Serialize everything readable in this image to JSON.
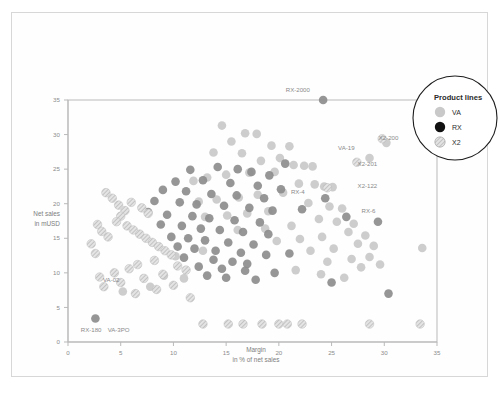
{
  "chart_data": {
    "type": "scatter",
    "title": "",
    "xlabel": "Margin",
    "xlabel_sub": "in % of net sales",
    "ylabel": "Net sales",
    "ylabel_sub": "in mUSD",
    "xlim": [
      0,
      35
    ],
    "ylim": [
      0,
      35
    ],
    "xticks": [
      0,
      5,
      10,
      15,
      20,
      25,
      30,
      35
    ],
    "yticks": [
      0,
      5,
      10,
      15,
      20,
      25,
      30,
      35
    ],
    "grid": false,
    "legend": {
      "title": "Product lines",
      "position": "top-right-circle",
      "entries": [
        {
          "name": "VA",
          "color": "#c9c9c9",
          "style": "solid"
        },
        {
          "name": "RX",
          "color": "#111111",
          "style": "solid"
        },
        {
          "name": "X2",
          "color": "#d2d2d2",
          "style": "hatched"
        }
      ]
    },
    "series": [
      {
        "name": "VA",
        "color": "#c9c9c9",
        "style": "solid",
        "points": [
          [
            14.6,
            31.3
          ],
          [
            16.8,
            30.2
          ],
          [
            17.9,
            30.1
          ],
          [
            15.5,
            29.0
          ],
          [
            19.3,
            28.4
          ],
          [
            21.0,
            28.3
          ],
          [
            13.8,
            27.4
          ],
          [
            16.5,
            27.3
          ],
          [
            18.3,
            26.2
          ],
          [
            20.1,
            26.6
          ],
          [
            21.4,
            25.6
          ],
          [
            22.4,
            25.5
          ],
          [
            23.2,
            25.4
          ],
          [
            19.6,
            24.6
          ],
          [
            17.2,
            24.5
          ],
          [
            15.0,
            24.2
          ],
          [
            13.2,
            23.8
          ],
          [
            11.9,
            23.3
          ],
          [
            21.9,
            22.9
          ],
          [
            23.4,
            22.8
          ],
          [
            24.3,
            22.5
          ],
          [
            25.1,
            22.4
          ],
          [
            20.4,
            21.6
          ],
          [
            18.0,
            21.3
          ],
          [
            16.2,
            20.9
          ],
          [
            14.1,
            20.6
          ],
          [
            12.4,
            20.3
          ],
          [
            22.8,
            20.1
          ],
          [
            24.8,
            19.6
          ],
          [
            26.0,
            19.3
          ],
          [
            19.0,
            18.9
          ],
          [
            17.0,
            18.6
          ],
          [
            15.1,
            18.3
          ],
          [
            13.0,
            18.1
          ],
          [
            23.8,
            17.8
          ],
          [
            25.5,
            17.4
          ],
          [
            27.1,
            17.1
          ],
          [
            21.2,
            16.8
          ],
          [
            18.7,
            16.4
          ],
          [
            16.1,
            16.2
          ],
          [
            26.6,
            15.9
          ],
          [
            28.2,
            15.4
          ],
          [
            24.1,
            15.2
          ],
          [
            22.0,
            14.9
          ],
          [
            19.8,
            14.6
          ],
          [
            27.5,
            14.2
          ],
          [
            29.0,
            13.9
          ],
          [
            25.2,
            13.5
          ],
          [
            23.0,
            13.2
          ],
          [
            33.6,
            13.6
          ],
          [
            28.6,
            12.3
          ],
          [
            26.9,
            12.0
          ],
          [
            24.6,
            11.6
          ],
          [
            29.6,
            11.2
          ],
          [
            27.8,
            10.8
          ],
          [
            21.6,
            10.4
          ],
          [
            24.0,
            9.8
          ],
          [
            26.2,
            9.3
          ],
          [
            5.2,
            7.3
          ],
          [
            9.1,
            9.6
          ],
          [
            11.0,
            9.2
          ],
          [
            7.8,
            8.0
          ],
          [
            28.6,
            26.6
          ],
          [
            12.8,
            13.2
          ],
          [
            30.2,
            28.8
          ],
          [
            10.2,
            12.4
          ]
        ]
      },
      {
        "name": "RX",
        "color": "#8d8d8d",
        "style": "solid",
        "points": [
          [
            24.2,
            35.0
          ],
          [
            11.6,
            24.9
          ],
          [
            14.2,
            25.3
          ],
          [
            16.1,
            25.0
          ],
          [
            17.4,
            24.6
          ],
          [
            19.1,
            24.1
          ],
          [
            10.2,
            23.2
          ],
          [
            12.8,
            23.4
          ],
          [
            15.4,
            23.0
          ],
          [
            18.0,
            22.6
          ],
          [
            20.2,
            22.1
          ],
          [
            9.0,
            22.0
          ],
          [
            11.2,
            21.8
          ],
          [
            13.6,
            21.4
          ],
          [
            16.0,
            21.2
          ],
          [
            18.6,
            20.8
          ],
          [
            8.2,
            20.4
          ],
          [
            10.6,
            20.2
          ],
          [
            12.2,
            19.9
          ],
          [
            14.8,
            19.7
          ],
          [
            17.2,
            19.4
          ],
          [
            19.4,
            19.0
          ],
          [
            7.6,
            18.8
          ],
          [
            9.4,
            18.4
          ],
          [
            11.8,
            18.2
          ],
          [
            13.4,
            17.9
          ],
          [
            15.8,
            17.6
          ],
          [
            18.2,
            17.3
          ],
          [
            8.8,
            17.0
          ],
          [
            10.8,
            16.8
          ],
          [
            12.6,
            16.4
          ],
          [
            14.4,
            16.2
          ],
          [
            16.6,
            15.9
          ],
          [
            19.0,
            15.6
          ],
          [
            9.8,
            15.2
          ],
          [
            11.4,
            15.0
          ],
          [
            13.0,
            14.7
          ],
          [
            15.2,
            14.4
          ],
          [
            17.6,
            14.1
          ],
          [
            10.4,
            13.8
          ],
          [
            12.0,
            13.5
          ],
          [
            14.0,
            13.2
          ],
          [
            16.4,
            12.9
          ],
          [
            18.8,
            12.6
          ],
          [
            11.0,
            12.2
          ],
          [
            13.8,
            11.9
          ],
          [
            15.6,
            11.6
          ],
          [
            17.0,
            11.3
          ],
          [
            12.4,
            10.9
          ],
          [
            14.6,
            10.6
          ],
          [
            16.8,
            10.3
          ],
          [
            19.6,
            10.0
          ],
          [
            13.2,
            9.6
          ],
          [
            15.0,
            9.3
          ],
          [
            17.8,
            9.0
          ],
          [
            24.4,
            20.8
          ],
          [
            26.4,
            18.1
          ],
          [
            29.4,
            17.4
          ],
          [
            25.0,
            8.6
          ],
          [
            30.4,
            7.0
          ],
          [
            2.6,
            3.4
          ],
          [
            20.6,
            25.8
          ],
          [
            22.2,
            19.2
          ],
          [
            21.0,
            12.8
          ]
        ]
      },
      {
        "name": "X2",
        "color": "#d2d2d2",
        "style": "hatched",
        "points": [
          [
            29.8,
            29.4
          ],
          [
            27.4,
            26.0
          ],
          [
            24.6,
            22.3
          ],
          [
            4.2,
            20.8
          ],
          [
            4.8,
            19.8
          ],
          [
            5.4,
            19.0
          ],
          [
            5.0,
            18.2
          ],
          [
            4.6,
            17.4
          ],
          [
            5.6,
            16.8
          ],
          [
            6.2,
            16.2
          ],
          [
            6.8,
            15.6
          ],
          [
            7.4,
            15.0
          ],
          [
            8.0,
            14.4
          ],
          [
            8.6,
            13.8
          ],
          [
            3.6,
            21.6
          ],
          [
            6.0,
            20.2
          ],
          [
            7.0,
            19.4
          ],
          [
            7.6,
            18.6
          ],
          [
            2.8,
            17.0
          ],
          [
            3.2,
            16.0
          ],
          [
            3.8,
            15.2
          ],
          [
            9.2,
            13.2
          ],
          [
            9.8,
            12.6
          ],
          [
            8.2,
            11.8
          ],
          [
            6.6,
            11.2
          ],
          [
            5.8,
            10.6
          ],
          [
            4.4,
            10.0
          ],
          [
            3.0,
            9.4
          ],
          [
            10.4,
            11.0
          ],
          [
            11.2,
            10.4
          ],
          [
            9.0,
            9.8
          ],
          [
            7.2,
            9.2
          ],
          [
            5.0,
            8.6
          ],
          [
            3.4,
            8.0
          ],
          [
            10.0,
            8.2
          ],
          [
            8.4,
            7.6
          ],
          [
            6.4,
            7.0
          ],
          [
            12.8,
            2.6
          ],
          [
            15.2,
            2.6
          ],
          [
            16.6,
            2.6
          ],
          [
            18.4,
            2.6
          ],
          [
            20.0,
            2.6
          ],
          [
            20.8,
            2.6
          ],
          [
            22.2,
            2.6
          ],
          [
            28.6,
            2.6
          ],
          [
            33.4,
            2.6
          ],
          [
            11.6,
            6.4
          ],
          [
            2.2,
            14.2
          ],
          [
            2.6,
            12.8
          ]
        ]
      }
    ],
    "annotations": [
      {
        "text": "RX-2000",
        "x": 24.2,
        "y": 35.0,
        "dx": -2.4,
        "dy": 1.4
      },
      {
        "text": "VA-19",
        "x": 28.6,
        "y": 26.6,
        "dx": -2.2,
        "dy": 1.5
      },
      {
        "text": "X2-200",
        "x": 32.0,
        "y": 28.0,
        "dx": -1.6,
        "dy": 1.5
      },
      {
        "text": "X2-201",
        "x": 29.8,
        "y": 24.2,
        "dx": -1.4,
        "dy": 1.5
      },
      {
        "text": "X2-122",
        "x": 27.4,
        "y": 22.3,
        "dx": 1.0,
        "dy": 0.3
      },
      {
        "text": "RX-4",
        "x": 24.4,
        "y": 20.8,
        "dx": -2.6,
        "dy": 0.9
      },
      {
        "text": "RX-6",
        "x": 29.4,
        "y": 17.4,
        "dx": -0.9,
        "dy": 1.5
      },
      {
        "text": "VA-02",
        "x": 5.2,
        "y": 7.3,
        "dx": -1.1,
        "dy": 1.7
      },
      {
        "text": "RX-180",
        "x": 2.6,
        "y": 3.4,
        "dx": -0.4,
        "dy": -1.6
      },
      {
        "text": "VA-3PO",
        "x": 5.2,
        "y": 3.4,
        "dx": -0.4,
        "dy": -1.6
      }
    ]
  }
}
